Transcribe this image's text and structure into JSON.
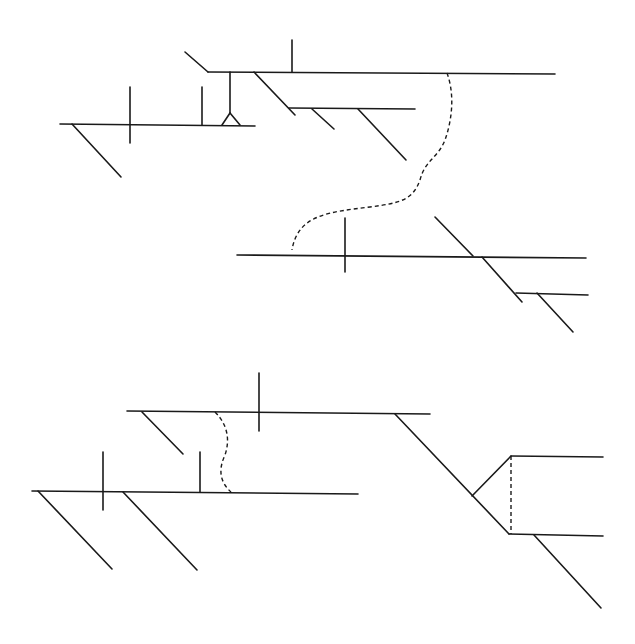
{
  "diagram": {
    "type": "sentence-diagram-line-art",
    "background": "#ffffff",
    "stroke_color": "#1a1a1a",
    "groups": [
      {
        "name": "upper-diagram",
        "solid_lines": [
          [
            185,
            52,
            208,
            72
          ],
          [
            208,
            72,
            555,
            74
          ],
          [
            292,
            40,
            292,
            72
          ],
          [
            230,
            72,
            230,
            113
          ],
          [
            222,
            125,
            230,
            113
          ],
          [
            230,
            113,
            240,
            125
          ],
          [
            60,
            124,
            255,
            126
          ],
          [
            130,
            87,
            130,
            143
          ],
          [
            202,
            87,
            202,
            125
          ],
          [
            72,
            124,
            121,
            177
          ],
          [
            254,
            72,
            295,
            115
          ],
          [
            289,
            108,
            415,
            109
          ],
          [
            312,
            109,
            334,
            129
          ],
          [
            358,
            109,
            406,
            160
          ]
        ],
        "dashed_paths": [
          "M447,73 C455,95 452,120 445,140 C438,158 425,160 420,180 C413,200 400,203 370,207 C330,212 298,214 292,250"
        ]
      },
      {
        "name": "middle-diagram",
        "solid_lines": [
          [
            237,
            255,
            586,
            258
          ],
          [
            345,
            218,
            345,
            272
          ],
          [
            435,
            217,
            473,
            256
          ],
          [
            482,
            257,
            522,
            302
          ],
          [
            516,
            293,
            588,
            295
          ],
          [
            537,
            293,
            573,
            332
          ]
        ],
        "dashed_paths": []
      },
      {
        "name": "lower-diagram",
        "solid_lines": [
          [
            127,
            411,
            430,
            414
          ],
          [
            259,
            373,
            259,
            431
          ],
          [
            142,
            412,
            183,
            454
          ],
          [
            32,
            491,
            358,
            494
          ],
          [
            103,
            452,
            103,
            510
          ],
          [
            200,
            452,
            200,
            492
          ],
          [
            38,
            491,
            112,
            569
          ],
          [
            123,
            492,
            197,
            570
          ],
          [
            395,
            414,
            509,
            534
          ],
          [
            472,
            496,
            511,
            456
          ],
          [
            511,
            456,
            603,
            457
          ],
          [
            509,
            534,
            603,
            536
          ],
          [
            534,
            535,
            601,
            608
          ]
        ],
        "dashed_paths": [
          "M215,412 C228,425 230,440 225,455 C218,470 220,482 231,492",
          "M511,456 L511,534"
        ]
      }
    ]
  }
}
